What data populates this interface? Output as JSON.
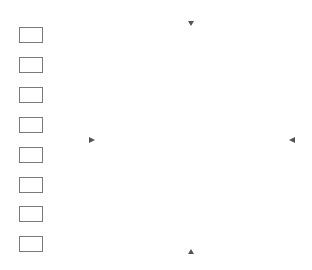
{
  "legend": {
    "items": [
      {
        "code": "445",
        "color": "#f7f7f7"
      },
      {
        "code": "783",
        "color": "#a9a9a9"
      },
      {
        "code": "471",
        "color": "#e3e3e3"
      },
      {
        "code": "992",
        "color": "#b4b4b4"
      },
      {
        "code": "3689",
        "color": "#dcdcdc"
      },
      {
        "code": "606",
        "color": "#4e4e4e"
      },
      {
        "code": "209",
        "color": "#7f7f7f"
      },
      {
        "code": "341",
        "color": "#cdcdcd"
      }
    ]
  },
  "pattern": {
    "grid_columns": 49,
    "grid_rows": 55,
    "major_line_every": 10,
    "colors": {
      "grid_minor": "#9a9a9a",
      "grid_major": "#3a3a3a",
      "petal": "#4e4e4e",
      "center": "#e0e0e0",
      "bud_ring": "#5a5a5a",
      "bud_center": "#a0a0a0",
      "leaf_dark": "#8a8a8a",
      "leaf_mid": "#a8a8a8",
      "leaf_light": "#c8c8c8",
      "stem_light": "#d8d8d8"
    }
  }
}
